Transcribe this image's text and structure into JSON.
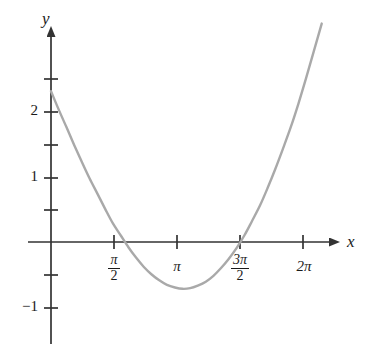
{
  "figure": {
    "kind": "cartesian-plot",
    "background_color": "#ffffff",
    "axis_color": "#333333",
    "curve_color": "#a9a9a9",
    "curve_width_px": 2.4
  },
  "axes": {
    "x_axis_label": "x",
    "y_axis_label": "y",
    "x_arrow": "right-arrow",
    "y_arrow": "up-arrow",
    "origin_px": {
      "x": 51,
      "y": 242
    },
    "x_unit_px_per_half_pi": 63,
    "y_unit_px_per_one": 65
  },
  "chart_data": {
    "type": "line",
    "title": "",
    "xlabel": "x",
    "ylabel": "y",
    "grid": false,
    "legend": "none",
    "xlim": [
      0,
      7.33
    ],
    "ylim": [
      -1.35,
      2.6
    ],
    "x_ticks": [
      {
        "value": 1.5708,
        "label_num": "π",
        "label_den": "2",
        "label": "π/2",
        "is_fraction": true
      },
      {
        "value": 3.1416,
        "label_num": "π",
        "label_den": "",
        "label": "π",
        "is_fraction": false
      },
      {
        "value": 4.7124,
        "label_num": "3π",
        "label_den": "2",
        "label": "3π/2",
        "is_fraction": true
      },
      {
        "value": 6.2832,
        "label_num": "2π",
        "label_den": "",
        "label": "2π",
        "is_fraction": false
      }
    ],
    "y_ticks": [
      {
        "value": 2.5,
        "label": ""
      },
      {
        "value": 2.0,
        "label": "2"
      },
      {
        "value": 1.5,
        "label": ""
      },
      {
        "value": 1.0,
        "label": "1"
      },
      {
        "value": 0.5,
        "label": ""
      },
      {
        "value": -0.5,
        "label": ""
      },
      {
        "value": -1.0,
        "label": "−1"
      }
    ],
    "series": [
      {
        "name": "curve",
        "color": "#a9a9a9",
        "x": [
          0.0,
          0.19,
          0.39,
          0.58,
          0.77,
          0.96,
          1.16,
          1.35,
          1.54,
          1.74,
          1.93,
          2.12,
          2.31,
          2.51,
          2.7,
          2.89,
          3.09,
          3.28,
          3.47,
          3.66,
          3.86,
          4.05,
          4.24,
          4.43,
          4.63,
          4.82,
          5.01,
          5.21,
          5.4,
          5.59,
          5.78,
          5.98,
          6.17,
          6.36,
          6.55,
          6.75
        ],
        "y": [
          2.32,
          2.04,
          1.76,
          1.49,
          1.23,
          0.98,
          0.74,
          0.51,
          0.29,
          0.1,
          -0.08,
          -0.24,
          -0.38,
          -0.5,
          -0.59,
          -0.66,
          -0.7,
          -0.72,
          -0.71,
          -0.67,
          -0.61,
          -0.52,
          -0.4,
          -0.26,
          -0.09,
          0.1,
          0.32,
          0.56,
          0.83,
          1.12,
          1.43,
          1.77,
          2.13,
          2.52,
          2.93,
          3.36
        ]
      }
    ],
    "annotations": {
      "x_intercepts": [
        1.5708,
        4.7124
      ],
      "minimum": {
        "x": 3.28,
        "y": -0.72
      },
      "y_intercept": 2.32
    }
  }
}
